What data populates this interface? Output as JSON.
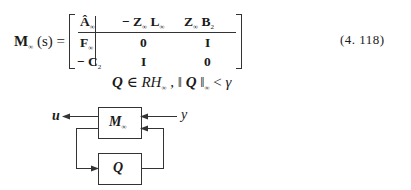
{
  "equation": {
    "lhs": "M",
    "lhs_sub": "∞",
    "lhs_arg": "(s) =",
    "matrix": {
      "row0": {
        "c0": "Â",
        "c0_sub": "∞",
        "c1a": "− Z",
        "c1a_sub": "∞",
        "c1b": "L",
        "c1b_sub": "∞",
        "c2a": "Z",
        "c2a_sub": "∞",
        "c2b": "B",
        "c2b_sub": "2"
      },
      "row1": {
        "c0": "F",
        "c0_sub": "∞",
        "c1": "0",
        "c2": "I"
      },
      "row2": {
        "c0": "− C",
        "c0_sub": "2",
        "c1": "I",
        "c2": "0"
      }
    },
    "number": "(4. 118)"
  },
  "condition": {
    "q": "Q",
    "in": " ∈ ",
    "rh": "RH",
    "rh_sub": "∞",
    "comma": " ,  ‖ ",
    "q2": "Q",
    "norm_close": " ‖",
    "norm_sub": "∞",
    "lt": " < ",
    "gamma": "γ"
  },
  "diagram": {
    "output_label": "u",
    "input_label": "y",
    "block_top": "M",
    "block_top_sub": "∞",
    "block_bottom": "Q"
  }
}
